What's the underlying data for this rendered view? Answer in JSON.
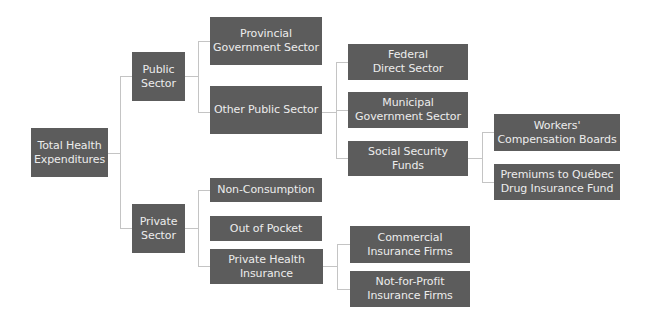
{
  "colors": {
    "node_fill": "#5c5c5c",
    "node_text": "#ececec",
    "connector": "#c4c4c4",
    "background": "#ffffff"
  },
  "nodes": {
    "total": {
      "label": "Total Health\nExpenditures"
    },
    "public": {
      "label": "Public\nSector"
    },
    "private": {
      "label": "Private\nSector"
    },
    "provincial": {
      "label": "Provincial\nGovernment Sector"
    },
    "other_public": {
      "label": "Other Public Sector"
    },
    "federal": {
      "label": "Federal\nDirect Sector"
    },
    "municipal": {
      "label": "Municipal\nGovernment Sector"
    },
    "social_security": {
      "label": "Social Security Funds"
    },
    "workers": {
      "label": "Workers'\nCompensation Boards"
    },
    "premiums": {
      "label": "Premiums to Québec\nDrug Insurance Fund"
    },
    "non_consumption": {
      "label": "Non-Consumption"
    },
    "out_of_pocket": {
      "label": "Out of Pocket"
    },
    "private_insurance": {
      "label": "Private Health\nInsurance"
    },
    "commercial": {
      "label": "Commercial\nInsurance Firms"
    },
    "not_for_profit": {
      "label": "Not-for-Profit\nInsurance Firms"
    }
  },
  "tree": {
    "label": "Total Health Expenditures",
    "children": [
      {
        "label": "Public Sector",
        "children": [
          {
            "label": "Provincial Government Sector"
          },
          {
            "label": "Other Public Sector",
            "children": [
              {
                "label": "Federal Direct Sector"
              },
              {
                "label": "Municipal Government Sector"
              },
              {
                "label": "Social Security Funds",
                "children": [
                  {
                    "label": "Workers' Compensation Boards"
                  },
                  {
                    "label": "Premiums to Québec Drug Insurance Fund"
                  }
                ]
              }
            ]
          }
        ]
      },
      {
        "label": "Private Sector",
        "children": [
          {
            "label": "Non-Consumption"
          },
          {
            "label": "Out of Pocket"
          },
          {
            "label": "Private Health Insurance",
            "children": [
              {
                "label": "Commercial Insurance Firms"
              },
              {
                "label": "Not-for-Profit Insurance Firms"
              }
            ]
          }
        ]
      }
    ]
  }
}
